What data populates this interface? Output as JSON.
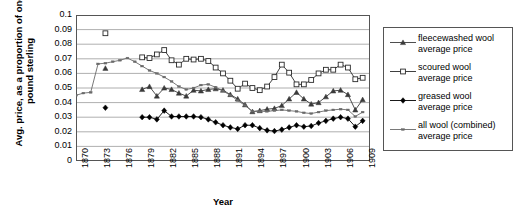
{
  "chart_data": {
    "type": "line",
    "title": "",
    "xlabel": "Year",
    "ylabel": "Avg. price, as a proportion of one pound sterling",
    "xlim": [
      1870,
      1910
    ],
    "ylim": [
      0,
      0.1
    ],
    "grid": true,
    "legend_position": "right",
    "y_ticks": [
      "0.1",
      "0.09",
      "0.08",
      "0.07",
      "0.06",
      "0.05",
      "0.04",
      "0.03",
      "0.02",
      "0.01",
      "0"
    ],
    "y_tick_values": [
      0.1,
      0.09,
      0.08,
      0.07,
      0.06,
      0.05,
      0.04,
      0.03,
      0.02,
      0.01,
      0
    ],
    "x_ticks": [
      "1870",
      "1873",
      "1876",
      "1879",
      "1882",
      "1885",
      "1888",
      "1891",
      "1894",
      "1897",
      "1900",
      "1903",
      "1906",
      "1909"
    ],
    "x_tick_values": [
      1870,
      1873,
      1876,
      1879,
      1882,
      1885,
      1888,
      1891,
      1894,
      1897,
      1900,
      1903,
      1906,
      1909
    ],
    "x": [
      1870,
      1871,
      1872,
      1873,
      1874,
      1875,
      1876,
      1877,
      1878,
      1879,
      1880,
      1881,
      1882,
      1883,
      1884,
      1885,
      1886,
      1887,
      1888,
      1889,
      1890,
      1891,
      1892,
      1893,
      1894,
      1895,
      1896,
      1897,
      1898,
      1899,
      1900,
      1901,
      1902,
      1903,
      1904,
      1905,
      1906,
      1907,
      1908,
      1909
    ],
    "series": [
      {
        "name": "fleecewashed wool average price",
        "marker": "filled-triangle",
        "color": "#3a3a3a",
        "values": [
          null,
          null,
          null,
          null,
          0.0635,
          null,
          null,
          null,
          null,
          0.049,
          0.051,
          0.0445,
          0.05,
          0.049,
          0.0465,
          0.0445,
          0.0485,
          0.048,
          0.049,
          0.0495,
          0.0485,
          0.0455,
          0.0425,
          0.0385,
          0.0338,
          0.0345,
          0.0355,
          0.036,
          0.038,
          0.0425,
          0.047,
          0.0425,
          0.039,
          0.04,
          0.044,
          0.048,
          0.0485,
          0.0455,
          0.035,
          0.042
        ]
      },
      {
        "name": "scoured wool average price",
        "marker": "open-square",
        "color": "#2a2a2a",
        "values": [
          null,
          null,
          null,
          null,
          0.0875,
          null,
          null,
          null,
          null,
          0.071,
          0.0705,
          0.073,
          0.076,
          0.069,
          0.066,
          0.07,
          0.0695,
          0.07,
          0.0685,
          0.064,
          0.06,
          0.055,
          0.0495,
          0.053,
          0.05,
          0.0485,
          0.051,
          0.0575,
          0.066,
          0.0605,
          0.0525,
          0.0525,
          0.0555,
          0.06,
          0.0625,
          0.0625,
          0.066,
          0.064,
          0.056,
          0.057
        ]
      },
      {
        "name": "greased wool average price",
        "marker": "filled-diamond",
        "color": "#000000",
        "values": [
          null,
          null,
          null,
          null,
          0.0365,
          null,
          null,
          null,
          null,
          0.03,
          0.03,
          0.0285,
          0.0345,
          0.0305,
          0.0305,
          0.0305,
          0.0305,
          0.03,
          0.0285,
          0.0265,
          0.0245,
          0.023,
          0.022,
          0.0245,
          0.0245,
          0.0225,
          0.021,
          0.0205,
          0.0215,
          0.023,
          0.0245,
          0.0235,
          0.024,
          0.026,
          0.0275,
          0.029,
          0.03,
          0.029,
          0.0235,
          0.0275
        ]
      },
      {
        "name": "all wool (combined) average price",
        "marker": "small-dash",
        "color": "#6a6a6a",
        "values": [
          0.045,
          0.0465,
          0.047,
          0.0665,
          0.067,
          0.068,
          0.069,
          0.0705,
          0.068,
          0.065,
          0.062,
          0.06,
          0.0575,
          0.0545,
          0.051,
          0.049,
          0.05,
          0.052,
          0.0525,
          0.0505,
          0.048,
          0.045,
          0.0415,
          0.038,
          0.034,
          0.034,
          0.034,
          0.0345,
          0.035,
          0.0345,
          0.034,
          0.033,
          0.0325,
          0.0335,
          0.0345,
          0.035,
          0.0355,
          0.035,
          0.0305,
          0.0335
        ]
      }
    ]
  },
  "legend": {
    "items": [
      {
        "label_line1": "fleecewashed wool",
        "label_line2": "average price"
      },
      {
        "label_line1": "scoured wool",
        "label_line2": "average price"
      },
      {
        "label_line1": "greased wool",
        "label_line2": "average price"
      },
      {
        "label_line1": "all wool (combined)",
        "label_line2": "average price"
      }
    ]
  }
}
